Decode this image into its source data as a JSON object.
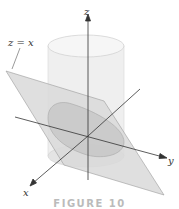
{
  "figure": {
    "caption": "FIGURE 10",
    "plane_label": "z = x",
    "axes": {
      "z": "z",
      "y": "y",
      "x": "x"
    },
    "colors": {
      "cylinder": "#e9e9e9",
      "plane": "#d8d8d8",
      "ellipse": "#c8c8c8",
      "axis": "#333333"
    }
  }
}
